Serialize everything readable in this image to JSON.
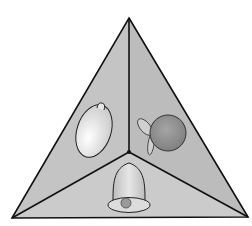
{
  "diagram": {
    "type": "triangular pyramid viewed from above",
    "faces": [
      {
        "name": "left-face",
        "object": "lemon"
      },
      {
        "name": "right-face",
        "object": "orange with leaves"
      },
      {
        "name": "bottom-face",
        "object": "bell"
      }
    ],
    "colors": {
      "background": "#ffffff",
      "face_left": "#c4c4c4",
      "face_right": "#bdbdbd",
      "face_bottom": "#cacaca",
      "outline": "#111111",
      "lemon": "#eeeeee",
      "orange": "#8e8e8e",
      "bell": "#dadada"
    }
  }
}
